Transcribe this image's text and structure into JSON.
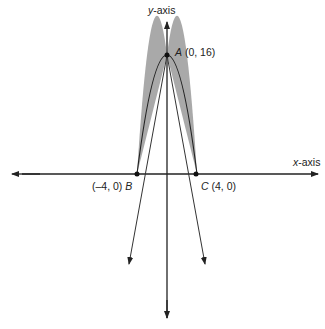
{
  "axes": {
    "x_label_var": "x",
    "x_label_rest": "-axis",
    "y_label_var": "y",
    "y_label_rest": "-axis"
  },
  "points": {
    "A": {
      "name": "A",
      "coords": "(0, 16)"
    },
    "B": {
      "name": "B",
      "coords": "(–4, 0)"
    },
    "C": {
      "name": "C",
      "coords": "(4, 0)"
    }
  },
  "colors": {
    "line": "#222222",
    "shade": "#a9a9a9"
  }
}
